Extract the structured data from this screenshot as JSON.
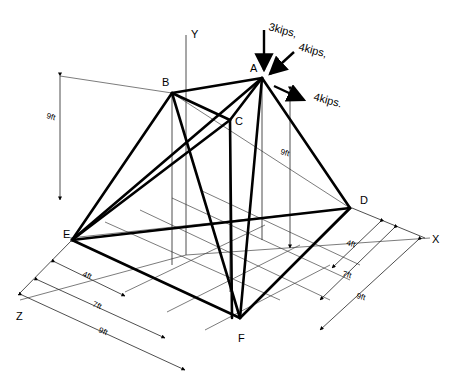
{
  "diagram": {
    "type": "space-truss",
    "nodes": {
      "A": {
        "label": "A"
      },
      "B": {
        "label": "B"
      },
      "C": {
        "label": "C"
      },
      "D": {
        "label": "D"
      },
      "E": {
        "label": "E"
      },
      "F": {
        "label": "F"
      }
    },
    "axes": {
      "x": "X",
      "y": "Y",
      "z": "Z"
    },
    "loads": {
      "vertical": "3kips,",
      "inclined": "4kips,",
      "horizontal": "4kips."
    },
    "dimensions": {
      "height_left": "9ft",
      "height_right": "9ft",
      "x_dims": [
        "4ft",
        "7ft",
        "9ft"
      ],
      "z_dims": [
        "4ft",
        "7ft",
        "9ft"
      ]
    }
  }
}
